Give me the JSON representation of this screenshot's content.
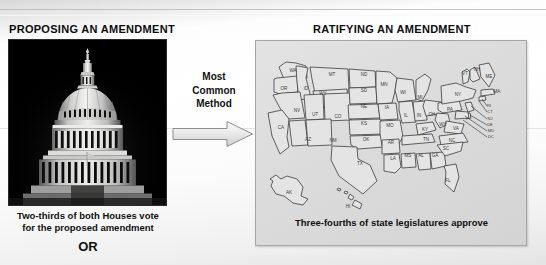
{
  "slide": {
    "left": {
      "title": "PROPOSING AN AMENDMENT",
      "photo_alt": "us-capitol-dome-photo",
      "caption_line1": "Two-thirds of both Houses vote",
      "caption_line2": "for the proposed amendment",
      "or_label": "OR"
    },
    "middle": {
      "method_line1": "Most",
      "method_line2": "Common",
      "method_line3": "Method",
      "arrow": "right-arrow-icon"
    },
    "right": {
      "title": "RATIFYING AN AMENDMENT",
      "caption": "Three-fourths of state legislatures approve",
      "map_alt": "united-states-map"
    }
  },
  "map": {
    "states": [
      {
        "abbr": "WA",
        "x": 33,
        "y": 27
      },
      {
        "abbr": "OR",
        "x": 24,
        "y": 45
      },
      {
        "abbr": "ID",
        "x": 46,
        "y": 45
      },
      {
        "abbr": "MT",
        "x": 72,
        "y": 31
      },
      {
        "abbr": "ND",
        "x": 104,
        "y": 31
      },
      {
        "abbr": "SD",
        "x": 104,
        "y": 47
      },
      {
        "abbr": "NE",
        "x": 104,
        "y": 63
      },
      {
        "abbr": "KS",
        "x": 104,
        "y": 80
      },
      {
        "abbr": "OK",
        "x": 106,
        "y": 96
      },
      {
        "abbr": "TX",
        "x": 100,
        "y": 120
      },
      {
        "abbr": "WY",
        "x": 63,
        "y": 50
      },
      {
        "abbr": "NV",
        "x": 37,
        "y": 67
      },
      {
        "abbr": "UT",
        "x": 55,
        "y": 71
      },
      {
        "abbr": "CO",
        "x": 78,
        "y": 73
      },
      {
        "abbr": "CA",
        "x": 21,
        "y": 84
      },
      {
        "abbr": "AZ",
        "x": 48,
        "y": 96
      },
      {
        "abbr": "NM",
        "x": 73,
        "y": 97
      },
      {
        "abbr": "MN",
        "x": 124,
        "y": 41
      },
      {
        "abbr": "IA",
        "x": 127,
        "y": 64
      },
      {
        "abbr": "MO",
        "x": 130,
        "y": 82
      },
      {
        "abbr": "AR",
        "x": 131,
        "y": 99
      },
      {
        "abbr": "LA",
        "x": 133,
        "y": 115
      },
      {
        "abbr": "WI",
        "x": 143,
        "y": 49
      },
      {
        "abbr": "IL",
        "x": 146,
        "y": 72
      },
      {
        "abbr": "MS",
        "x": 148,
        "y": 112
      },
      {
        "abbr": "MI",
        "x": 160,
        "y": 54
      },
      {
        "abbr": "IN",
        "x": 159,
        "y": 72
      },
      {
        "abbr": "KY",
        "x": 165,
        "y": 86
      },
      {
        "abbr": "TN",
        "x": 166,
        "y": 96
      },
      {
        "abbr": "AL",
        "x": 161,
        "y": 112
      },
      {
        "abbr": "GA",
        "x": 175,
        "y": 112
      },
      {
        "abbr": "OH",
        "x": 172,
        "y": 71
      },
      {
        "abbr": "WV",
        "x": 183,
        "y": 81
      },
      {
        "abbr": "VA",
        "x": 196,
        "y": 85
      },
      {
        "abbr": "NC",
        "x": 192,
        "y": 97
      },
      {
        "abbr": "SC",
        "x": 186,
        "y": 105
      },
      {
        "abbr": "FL",
        "x": 188,
        "y": 137
      },
      {
        "abbr": "PA",
        "x": 190,
        "y": 66
      },
      {
        "abbr": "NY",
        "x": 198,
        "y": 51
      },
      {
        "abbr": "VT",
        "x": 205,
        "y": 30
      },
      {
        "abbr": "NH",
        "x": 217,
        "y": 26
      },
      {
        "abbr": "ME",
        "x": 229,
        "y": 33
      },
      {
        "abbr": "MA",
        "x": 237,
        "y": 48
      },
      {
        "abbr": "AK",
        "x": 29,
        "y": 149
      },
      {
        "abbr": "HI",
        "x": 88,
        "y": 163
      }
    ],
    "leader_labels": [
      {
        "abbr": "RI",
        "x": 229,
        "y": 62
      },
      {
        "abbr": "CT",
        "x": 230,
        "y": 68
      },
      {
        "abbr": "NJ",
        "x": 230,
        "y": 75
      },
      {
        "abbr": "DE",
        "x": 230,
        "y": 81
      },
      {
        "abbr": "MD",
        "x": 231,
        "y": 87
      },
      {
        "abbr": "DC",
        "x": 231,
        "y": 93
      }
    ]
  },
  "colors": {
    "text": "#111111",
    "panel_bg": "#dcdcdc",
    "panel_border": "#a6a6a6",
    "map_fill": "#e2e2e2",
    "map_stroke": "#3a3a3a",
    "arrow_fill": "#e6e6e6",
    "slide_bg": "#ffffff"
  }
}
